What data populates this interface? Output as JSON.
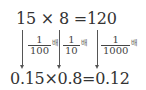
{
  "top_equation": {
    "a": "15",
    "op": "×",
    "b": "8",
    "eq": "=",
    "result": "120"
  },
  "bottom_equation": {
    "text": "0.15×0.8=0.12"
  },
  "annotations": [
    {
      "numerator": "1",
      "denominator": "100",
      "unit": "배"
    },
    {
      "numerator": "1",
      "denominator": "10",
      "unit": "배"
    },
    {
      "numerator": "1",
      "denominator": "1000",
      "unit": "배"
    }
  ]
}
